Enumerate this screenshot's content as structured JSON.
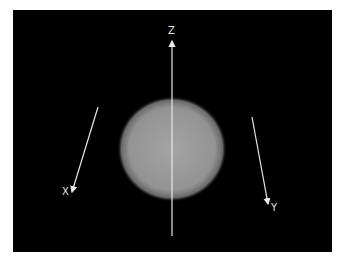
{
  "figure": {
    "background_color": "#000000",
    "sphere": {
      "center_x": 172,
      "center_y": 149,
      "radius_x": 53,
      "radius_y": 51,
      "color": "#9a9a9a"
    },
    "axes": [
      {
        "name": "x-axis",
        "label": "X",
        "from": [
          98,
          107
        ],
        "to": [
          72,
          192
        ],
        "label_pos": [
          62,
          187
        ]
      },
      {
        "name": "y-axis",
        "label": "Y",
        "from": [
          252,
          117
        ],
        "to": [
          268,
          204
        ],
        "label_pos": [
          271,
          203
        ]
      },
      {
        "name": "z-axis",
        "label": "Z",
        "from": [
          172,
          236
        ],
        "to": [
          172,
          41
        ],
        "label_pos": [
          168,
          26
        ]
      }
    ],
    "axis_color": "#e8e8e8"
  },
  "caption": {
    "text": ""
  }
}
